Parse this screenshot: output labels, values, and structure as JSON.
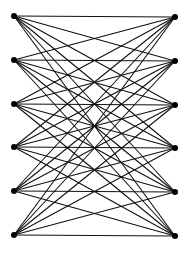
{
  "diagram": {
    "type": "complete-bipartite-graph",
    "label": "K6,6",
    "colors": {
      "background": "#ffffff",
      "edge": "#111111",
      "node": "#000000"
    },
    "left_nodes": [
      {
        "id": "L1",
        "x": 14,
        "y": 16
      },
      {
        "id": "L2",
        "x": 14,
        "y": 60
      },
      {
        "id": "L3",
        "x": 14,
        "y": 104
      },
      {
        "id": "L4",
        "x": 14,
        "y": 147
      },
      {
        "id": "L5",
        "x": 14,
        "y": 191
      },
      {
        "id": "L6",
        "x": 14,
        "y": 235
      }
    ],
    "right_nodes": [
      {
        "id": "R1",
        "x": 175,
        "y": 17
      },
      {
        "id": "R2",
        "x": 175,
        "y": 61
      },
      {
        "id": "R3",
        "x": 175,
        "y": 105
      },
      {
        "id": "R4",
        "x": 175,
        "y": 148
      },
      {
        "id": "R5",
        "x": 175,
        "y": 192
      },
      {
        "id": "R6",
        "x": 175,
        "y": 236
      }
    ],
    "node_radius": 3,
    "edge_width": 1.1
  }
}
